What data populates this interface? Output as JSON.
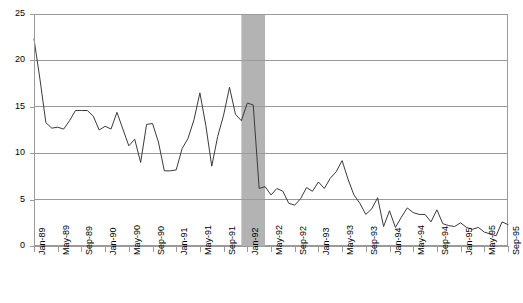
{
  "chart_data": {
    "type": "line",
    "title": "",
    "subtitle": "",
    "xlabel": "",
    "ylabel": "",
    "ylim": [
      0,
      25
    ],
    "ytick_values": [
      0,
      5,
      10,
      15,
      20,
      25
    ],
    "ytick_labels": [
      "0",
      "5",
      "10",
      "15",
      "20",
      "25"
    ],
    "grid": "horizontal",
    "legend": "none",
    "x_start_label": "Jan-89",
    "x_end_label": "Sep-95",
    "x_tick_interval_months": 4,
    "xtick_labels": [
      "Jan-89",
      "May-89",
      "Sep-89",
      "Jan-90",
      "May-90",
      "Sep-90",
      "Jan-91",
      "May-91",
      "Sep-91",
      "Jan-92",
      "May-92",
      "Sep-92",
      "Jan-93",
      "May-93",
      "Sep-93",
      "Jan-94",
      "May-94",
      "Sep-94",
      "Jan-95",
      "May-95",
      "Sep-95"
    ],
    "x": [
      "Jan-89",
      "Feb-89",
      "Mar-89",
      "Apr-89",
      "May-89",
      "Jun-89",
      "Jul-89",
      "Aug-89",
      "Sep-89",
      "Oct-89",
      "Nov-89",
      "Dec-89",
      "Jan-90",
      "Feb-90",
      "Mar-90",
      "Apr-90",
      "May-90",
      "Jun-90",
      "Jul-90",
      "Aug-90",
      "Sep-90",
      "Oct-90",
      "Nov-90",
      "Dec-90",
      "Jan-91",
      "Feb-91",
      "Mar-91",
      "Apr-91",
      "May-91",
      "Jun-91",
      "Jul-91",
      "Aug-91",
      "Sep-91",
      "Oct-91",
      "Nov-91",
      "Dec-91",
      "Jan-92",
      "Feb-92",
      "Mar-92",
      "Apr-92",
      "May-92",
      "Jun-92",
      "Jul-92",
      "Aug-92",
      "Sep-92",
      "Oct-92",
      "Nov-92",
      "Dec-92",
      "Jan-93",
      "Feb-93",
      "Mar-93",
      "Apr-93",
      "May-93",
      "Jun-93",
      "Jul-93",
      "Aug-93",
      "Sep-93",
      "Oct-93",
      "Nov-93",
      "Dec-93",
      "Jan-94",
      "Feb-94",
      "Mar-94",
      "Apr-94",
      "May-94",
      "Jun-94",
      "Jul-94",
      "Aug-94",
      "Sep-94",
      "Oct-94",
      "Nov-94",
      "Dec-94",
      "Jan-95",
      "Feb-95",
      "Mar-95",
      "Apr-95",
      "May-95",
      "Jun-95",
      "Jul-95",
      "Aug-95",
      "Sep-95"
    ],
    "values": [
      22.3,
      18.0,
      13.3,
      12.7,
      12.8,
      12.6,
      13.5,
      14.6,
      14.6,
      14.6,
      14.0,
      12.5,
      12.9,
      12.6,
      14.4,
      12.6,
      10.8,
      11.5,
      9.0,
      13.1,
      13.2,
      11.2,
      8.1,
      8.1,
      8.2,
      10.5,
      11.6,
      13.6,
      16.5,
      13.0,
      8.6,
      11.8,
      14.1,
      17.1,
      14.2,
      13.5,
      15.4,
      15.2,
      6.2,
      6.4,
      5.5,
      6.2,
      5.9,
      4.6,
      4.4,
      5.1,
      6.3,
      5.9,
      6.9,
      6.2,
      7.3,
      8.0,
      9.2,
      7.2,
      5.5,
      4.6,
      3.4,
      4.0,
      5.2,
      2.1,
      3.8,
      2.0,
      3.1,
      4.1,
      3.6,
      3.4,
      3.4,
      2.6,
      3.9,
      2.4,
      2.2,
      2.1,
      2.5,
      2.0,
      1.8,
      2.0,
      1.5,
      1.3,
      1.1,
      2.6,
      2.3
    ],
    "series_name": "",
    "line_color": "#3a3a3a",
    "grid_color": "#9a9a9a",
    "band": {
      "label": "",
      "from": "Dec-91",
      "to": "Apr-92",
      "color": "#b3b3b3"
    }
  }
}
